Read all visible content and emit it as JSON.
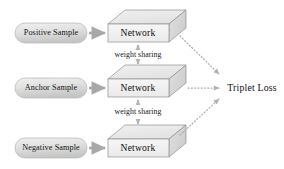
{
  "diagram": {
    "colors": {
      "background": "#ffffff",
      "pill_fill_light": "#e8e8e8",
      "pill_fill_dark": "#c9c9c9",
      "pill_stroke": "#b5b5b5",
      "box_front_fill": "#f2f2f2",
      "box_top_fill": "#ececec",
      "box_side_fill": "#dcdcdc",
      "box_stroke": "#8f8f8f",
      "solid_arrow": "#a8a8a8",
      "dotted_arrow": "#b0b0b0",
      "share_arrow": "#b3b3b3",
      "text": "#101010"
    },
    "rows": [
      {
        "id": "positive",
        "sample_label": "Positive Sample",
        "network_label": "Network"
      },
      {
        "id": "anchor",
        "sample_label": "Anchor Sample",
        "network_label": "Network"
      },
      {
        "id": "negative",
        "sample_label": "Negative Sample",
        "network_label": "Network"
      }
    ],
    "weight_sharing": [
      {
        "id": "share-top",
        "label": "weight sharing"
      },
      {
        "id": "share-bottom",
        "label": "weight sharing"
      }
    ],
    "output": {
      "label": "Triplet Loss"
    },
    "icons": {
      "solid_arrow": "arrow-right-icon",
      "dotted_arrow": "dotted-arrow-icon",
      "double_arrow": "double-arrow-vertical-icon",
      "cuboid": "cuboid-icon"
    }
  }
}
